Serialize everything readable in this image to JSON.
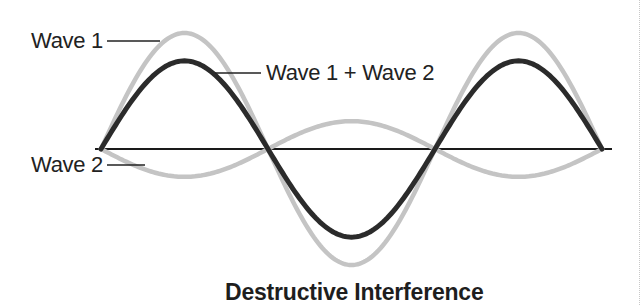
{
  "title": "Destructive Interference",
  "labels": {
    "wave1": "Wave 1",
    "sum": "Wave 1 + Wave 2",
    "wave2": "Wave 2"
  },
  "colors": {
    "wave1": "#c4c4c4",
    "wave2": "#c4c4c4",
    "sum": "#2b2b2b",
    "axis": "#1a1a1a",
    "text": "#222222"
  },
  "chart_data": {
    "type": "line",
    "title": "Destructive Interference",
    "xlabel": "",
    "ylabel": "",
    "grid": false,
    "x_cycles": [
      0,
      0.25,
      0.5,
      0.75,
      1.0,
      1.25,
      1.5
    ],
    "series": [
      {
        "name": "Wave 1",
        "amplitude": 1.0,
        "phase": 0,
        "values": [
          0,
          1.0,
          0,
          -1.0,
          0,
          1.0,
          0
        ]
      },
      {
        "name": "Wave 2",
        "amplitude": 0.24,
        "phase": 180,
        "values": [
          0,
          -0.24,
          0,
          0.24,
          0,
          -0.24,
          0
        ]
      },
      {
        "name": "Wave 1 + Wave 2",
        "amplitude": 0.76,
        "phase": 0,
        "values": [
          0,
          0.76,
          0,
          -0.76,
          0,
          0.76,
          0
        ]
      }
    ],
    "legend_position": "inline-leader-labels"
  }
}
